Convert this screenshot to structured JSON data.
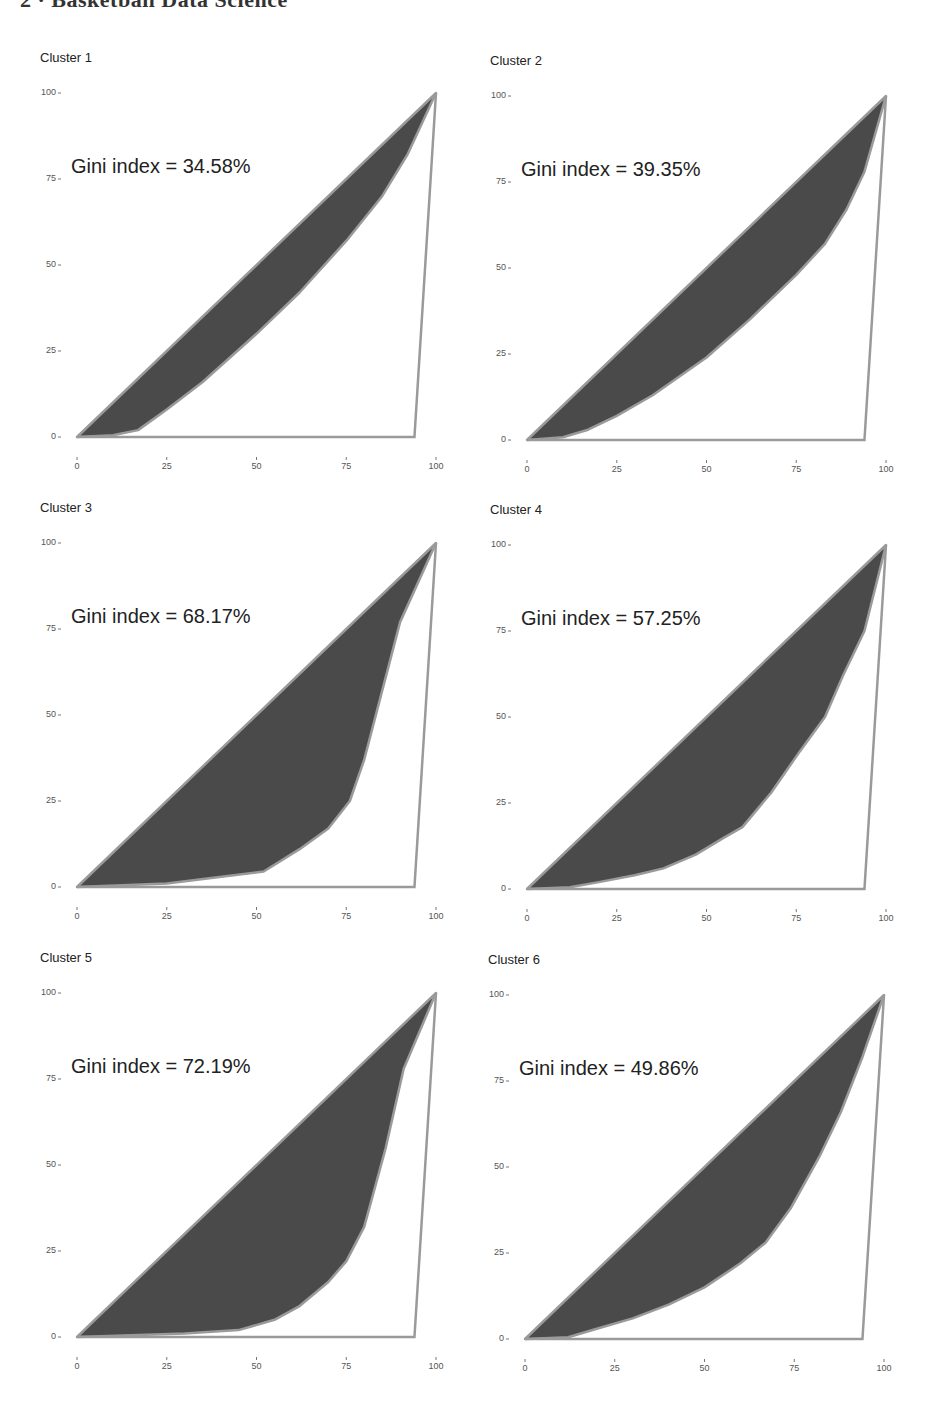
{
  "header": {
    "running_head": "2   ·   Basketball Data Science"
  },
  "style": {
    "fill_color": "#4a4a4a",
    "line_color": "#9a9a9a",
    "background": "#ffffff"
  },
  "panels": [
    {
      "title": "Cluster 1",
      "gini_label": "Gini index = 34.58%"
    },
    {
      "title": "Cluster 2",
      "gini_label": "Gini index = 39.35%"
    },
    {
      "title": "Cluster 3",
      "gini_label": "Gini index = 68.17%"
    },
    {
      "title": "Cluster 4",
      "gini_label": "Gini index = 57.25%"
    },
    {
      "title": "Cluster 5",
      "gini_label": "Gini index = 72.19%"
    },
    {
      "title": "Cluster 6",
      "gini_label": "Gini index = 49.86%"
    }
  ],
  "axis": {
    "y_ticks": [
      "100",
      "75",
      "50",
      "25",
      "0"
    ],
    "x_ticks": [
      "0",
      "25",
      "50",
      "75",
      "100"
    ]
  },
  "chart_data": [
    {
      "type": "area",
      "title": "Cluster 1",
      "annotation": "Gini index = 34.58%",
      "gini": 34.58,
      "xlim": [
        0,
        100
      ],
      "ylim": [
        0,
        100
      ],
      "grid": false,
      "x_ticks": [
        0,
        25,
        50,
        75,
        100
      ],
      "y_ticks": [
        0,
        25,
        50,
        75,
        100
      ],
      "equality_line": [
        [
          0,
          0
        ],
        [
          100,
          100
        ]
      ],
      "max_inequality_line": [
        [
          0,
          0
        ],
        [
          94,
          0
        ],
        [
          100,
          100
        ]
      ],
      "lorenz_curve": [
        [
          0,
          0
        ],
        [
          10,
          0.5
        ],
        [
          17,
          2
        ],
        [
          25,
          8
        ],
        [
          35,
          16
        ],
        [
          50,
          30
        ],
        [
          62,
          42
        ],
        [
          75,
          57
        ],
        [
          85,
          70
        ],
        [
          92,
          82
        ],
        [
          100,
          100
        ]
      ]
    },
    {
      "type": "area",
      "title": "Cluster 2",
      "annotation": "Gini index = 39.35%",
      "gini": 39.35,
      "xlim": [
        0,
        100
      ],
      "ylim": [
        0,
        100
      ],
      "grid": false,
      "x_ticks": [
        0,
        25,
        50,
        75,
        100
      ],
      "y_ticks": [
        0,
        25,
        50,
        75,
        100
      ],
      "equality_line": [
        [
          0,
          0
        ],
        [
          100,
          100
        ]
      ],
      "max_inequality_line": [
        [
          0,
          0
        ],
        [
          94,
          0
        ],
        [
          100,
          100
        ]
      ],
      "lorenz_curve": [
        [
          0,
          0
        ],
        [
          10,
          0.8
        ],
        [
          17,
          3
        ],
        [
          25,
          7
        ],
        [
          35,
          13
        ],
        [
          50,
          24
        ],
        [
          62,
          35
        ],
        [
          75,
          48
        ],
        [
          83,
          57
        ],
        [
          89,
          67
        ],
        [
          94,
          78
        ],
        [
          100,
          100
        ]
      ]
    },
    {
      "type": "area",
      "title": "Cluster 3",
      "annotation": "Gini index = 68.17%",
      "gini": 68.17,
      "xlim": [
        0,
        100
      ],
      "ylim": [
        0,
        100
      ],
      "grid": false,
      "x_ticks": [
        0,
        25,
        50,
        75,
        100
      ],
      "y_ticks": [
        0,
        25,
        50,
        75,
        100
      ],
      "equality_line": [
        [
          0,
          0
        ],
        [
          100,
          100
        ]
      ],
      "max_inequality_line": [
        [
          0,
          0
        ],
        [
          94,
          0
        ],
        [
          100,
          100
        ]
      ],
      "lorenz_curve": [
        [
          0,
          0
        ],
        [
          25,
          1
        ],
        [
          52,
          4.5
        ],
        [
          62,
          11
        ],
        [
          70,
          17
        ],
        [
          76,
          25
        ],
        [
          80,
          37
        ],
        [
          85,
          57
        ],
        [
          90,
          77
        ],
        [
          100,
          100
        ]
      ]
    },
    {
      "type": "area",
      "title": "Cluster 4",
      "annotation": "Gini index = 57.25%",
      "gini": 57.25,
      "xlim": [
        0,
        100
      ],
      "ylim": [
        0,
        100
      ],
      "grid": false,
      "x_ticks": [
        0,
        25,
        50,
        75,
        100
      ],
      "y_ticks": [
        0,
        25,
        50,
        75,
        100
      ],
      "equality_line": [
        [
          0,
          0
        ],
        [
          100,
          100
        ]
      ],
      "max_inequality_line": [
        [
          0,
          0
        ],
        [
          94,
          0
        ],
        [
          100,
          100
        ]
      ],
      "lorenz_curve": [
        [
          0,
          0
        ],
        [
          12,
          0.5
        ],
        [
          20,
          2
        ],
        [
          30,
          4
        ],
        [
          38,
          6
        ],
        [
          47,
          10
        ],
        [
          55,
          15
        ],
        [
          60,
          18
        ],
        [
          68,
          28
        ],
        [
          76,
          40
        ],
        [
          83,
          50
        ],
        [
          88,
          62
        ],
        [
          94,
          75
        ],
        [
          100,
          100
        ]
      ]
    },
    {
      "type": "area",
      "title": "Cluster 5",
      "annotation": "Gini index = 72.19%",
      "gini": 72.19,
      "xlim": [
        0,
        100
      ],
      "ylim": [
        0,
        100
      ],
      "grid": false,
      "x_ticks": [
        0,
        25,
        50,
        75,
        100
      ],
      "y_ticks": [
        0,
        25,
        50,
        75,
        100
      ],
      "equality_line": [
        [
          0,
          0
        ],
        [
          100,
          100
        ]
      ],
      "max_inequality_line": [
        [
          0,
          0
        ],
        [
          94,
          0
        ],
        [
          100,
          100
        ]
      ],
      "lorenz_curve": [
        [
          0,
          0
        ],
        [
          30,
          1
        ],
        [
          45,
          2
        ],
        [
          55,
          5
        ],
        [
          62,
          9
        ],
        [
          70,
          16
        ],
        [
          75,
          22
        ],
        [
          80,
          32
        ],
        [
          86,
          55
        ],
        [
          91,
          78
        ],
        [
          100,
          100
        ]
      ]
    },
    {
      "type": "area",
      "title": "Cluster 6",
      "annotation": "Gini index = 49.86%",
      "gini": 49.86,
      "xlim": [
        0,
        100
      ],
      "ylim": [
        0,
        100
      ],
      "grid": false,
      "x_ticks": [
        0,
        25,
        50,
        75,
        100
      ],
      "y_ticks": [
        0,
        25,
        50,
        75,
        100
      ],
      "equality_line": [
        [
          0,
          0
        ],
        [
          100,
          100
        ]
      ],
      "max_inequality_line": [
        [
          0,
          0
        ],
        [
          94,
          0
        ],
        [
          100,
          100
        ]
      ],
      "lorenz_curve": [
        [
          0,
          0
        ],
        [
          12,
          0.5
        ],
        [
          20,
          3
        ],
        [
          30,
          6
        ],
        [
          40,
          10
        ],
        [
          50,
          15
        ],
        [
          60,
          22
        ],
        [
          67,
          28
        ],
        [
          74,
          38
        ],
        [
          82,
          53
        ],
        [
          88,
          66
        ],
        [
          94,
          82
        ],
        [
          100,
          100
        ]
      ]
    }
  ]
}
